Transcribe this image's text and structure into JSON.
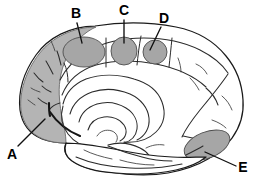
{
  "figure": {
    "view": "midsagittal",
    "background_color": "#ffffff",
    "outline_color": "#1a1a1a",
    "shade_color": "#b4b4b4",
    "patch_color": "#a6a6a6"
  },
  "labels": [
    {
      "id": "A",
      "text": "A",
      "x": 12,
      "y": 155,
      "anchor": "middle",
      "leader": "M 18 146 L 45 119",
      "target_region": "frontal-pole-shaded-region"
    },
    {
      "id": "B",
      "text": "B",
      "x": 76,
      "y": 14,
      "anchor": "middle",
      "leader": "M 77 23 L 82 43",
      "target_region": "region-b-ellipse"
    },
    {
      "id": "C",
      "text": "C",
      "x": 124,
      "y": 11,
      "anchor": "middle",
      "leader": "M 124 20 L 124 43",
      "target_region": "region-c-circle"
    },
    {
      "id": "D",
      "text": "D",
      "x": 164,
      "y": 19,
      "anchor": "middle",
      "leader": "M 161 27 L 150 50",
      "target_region": "region-d-circle"
    },
    {
      "id": "E",
      "text": "E",
      "x": 243,
      "y": 168,
      "anchor": "middle",
      "leader": "M 236 166 L 205 152",
      "target_region": "region-e-ellipse"
    }
  ],
  "regions": [
    {
      "id": "region-a",
      "name": "frontal-pole-shaded-region",
      "shape": "irregular-shaded-area",
      "fill": "#b4b4b4"
    },
    {
      "id": "region-b",
      "name": "region-b-ellipse",
      "shape": "ellipse",
      "cx": 84,
      "cy": 52,
      "rx": 21,
      "ry": 15,
      "fill": "#a6a6a6"
    },
    {
      "id": "region-c",
      "name": "region-c-circle",
      "shape": "ellipse",
      "cx": 124,
      "cy": 51,
      "rx": 13,
      "ry": 14,
      "fill": "#a6a6a6"
    },
    {
      "id": "region-d",
      "name": "region-d-circle",
      "shape": "ellipse",
      "cx": 155,
      "cy": 52,
      "rx": 12,
      "ry": 12,
      "fill": "#a6a6a6"
    },
    {
      "id": "region-e",
      "name": "region-e-ellipse",
      "shape": "ellipse",
      "cx": 207,
      "cy": 145,
      "rx": 24,
      "ry": 13,
      "rotation": -22,
      "fill": "#a6a6a6"
    }
  ]
}
